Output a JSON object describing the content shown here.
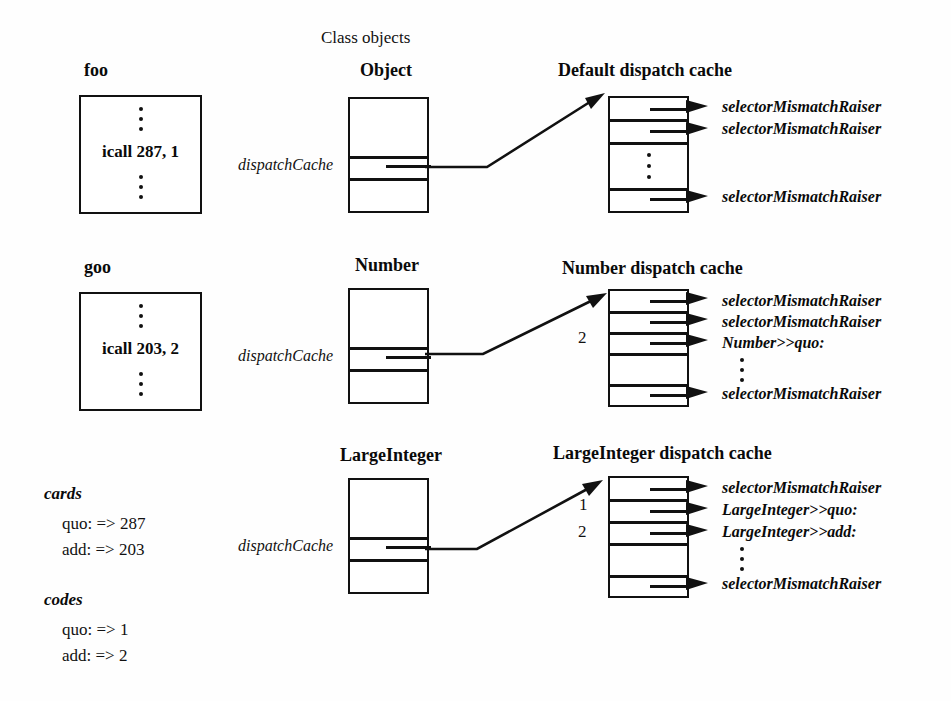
{
  "figure": {
    "column_header": "Class objects"
  },
  "methods": [
    {
      "name": "foo",
      "instruction": "icall 287, 1"
    },
    {
      "name": "goo",
      "instruction": "icall 203, 2"
    }
  ],
  "classes": [
    {
      "name": "Object",
      "slot_label": "dispatchCache"
    },
    {
      "name": "Number",
      "slot_label": "dispatchCache"
    },
    {
      "name": "LargeInteger",
      "slot_label": "dispatchCache"
    }
  ],
  "caches": [
    {
      "title": "Default dispatch cache",
      "index_labels": [],
      "top_entries": [
        "selectorMismatchRaiser",
        "selectorMismatchRaiser"
      ],
      "bottom_entry": "selectorMismatchRaiser"
    },
    {
      "title": "Number dispatch cache",
      "index_labels": [
        {
          "text": "2",
          "row": 3
        }
      ],
      "top_entries": [
        "selectorMismatchRaiser",
        "selectorMismatchRaiser",
        "Number>>quo:"
      ],
      "bottom_entry": "selectorMismatchRaiser"
    },
    {
      "title": "LargeInteger dispatch cache",
      "index_labels": [
        {
          "text": "1",
          "row": 2
        },
        {
          "text": "2",
          "row": 3
        }
      ],
      "top_entries": [
        "selectorMismatchRaiser",
        "LargeInteger>>quo:",
        "LargeInteger>>add:"
      ],
      "bottom_entry": "selectorMismatchRaiser"
    }
  ],
  "legend": {
    "cards": {
      "title": "cards",
      "rows": [
        "quo: => 287",
        "add: => 203"
      ]
    },
    "codes": {
      "title": "codes",
      "rows": [
        "quo: => 1",
        "add: => 2"
      ]
    }
  }
}
